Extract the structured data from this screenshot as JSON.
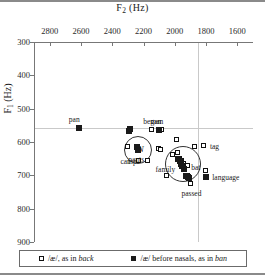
{
  "chart_data": {
    "type": "scatter",
    "title": "",
    "xlabel": "F2 (Hz)",
    "ylabel": "F1 (Hz)",
    "xlabel_base": "F",
    "xlabel_sub": "2",
    "xlabel_unit": " (Hz)",
    "ylabel_base": "F",
    "ylabel_sub": "1",
    "ylabel_unit": " (Hz)",
    "x_axis_position": "top",
    "y_axis_position": "left",
    "x_reversed": true,
    "y_reversed": true,
    "xlim": [
      2900,
      1500
    ],
    "ylim": [
      300,
      900
    ],
    "xticks": [
      2800,
      2600,
      2400,
      2200,
      2000,
      1800,
      1600
    ],
    "yticks": [
      300,
      400,
      500,
      600,
      700,
      800,
      900
    ],
    "xtick_labels": [
      "2800",
      "2600",
      "2400",
      "2200",
      "2000",
      "1800",
      "1600"
    ],
    "ytick_labels": [
      "300",
      "400",
      "500",
      "600",
      "700",
      "800",
      "900"
    ],
    "grid": true,
    "gridlines": {
      "horizontal": [
        555
      ],
      "vertical": [
        1860
      ]
    },
    "legend_position": "bottom",
    "series": [
      {
        "name": "/æ/, as in back",
        "marker": "open-square",
        "points": [
          {
            "x": 2305,
            "y": 613,
            "label": ""
          },
          {
            "x": 2235,
            "y": 655,
            "label": ""
          },
          {
            "x": 2175,
            "y": 655,
            "label": "camp",
            "label_pos": "left"
          },
          {
            "x": 2150,
            "y": 560,
            "label": "began",
            "label_pos": "above"
          },
          {
            "x": 2085,
            "y": 560,
            "label": "man2",
            "label_pos": "none"
          },
          {
            "x": 2110,
            "y": 617,
            "label": "",
            "label_pos": "none"
          },
          {
            "x": 2095,
            "y": 620,
            "label": "",
            "label_pos": "none"
          },
          {
            "x": 2020,
            "y": 635,
            "label": "",
            "label_pos": "none"
          },
          {
            "x": 1995,
            "y": 590,
            "label": "",
            "label_pos": "none"
          },
          {
            "x": 1985,
            "y": 630,
            "label": "",
            "label_pos": "none"
          },
          {
            "x": 1975,
            "y": 648,
            "label": "",
            "label_pos": "none"
          },
          {
            "x": 1960,
            "y": 655,
            "label": "",
            "label_pos": "none"
          },
          {
            "x": 1950,
            "y": 662,
            "label": "",
            "label_pos": "none"
          },
          {
            "x": 1940,
            "y": 672,
            "label": "bat",
            "label_pos": "right"
          },
          {
            "x": 1925,
            "y": 668,
            "label": "",
            "label_pos": "none"
          },
          {
            "x": 1920,
            "y": 700,
            "label": "",
            "label_pos": "none"
          },
          {
            "x": 2055,
            "y": 700,
            "label": "",
            "label_pos": "none"
          },
          {
            "x": 1900,
            "y": 722,
            "label": "passed",
            "label_pos": "below"
          },
          {
            "x": 1880,
            "y": 612,
            "label": "",
            "label_pos": "none"
          },
          {
            "x": 1820,
            "y": 608,
            "label": "tag",
            "label_pos": "right"
          },
          {
            "x": 1810,
            "y": 685,
            "label": "",
            "label_pos": "none"
          }
        ]
      },
      {
        "name": "/æ/ before nasals, as in ban",
        "marker": "filled-square",
        "points": [
          {
            "x": 2620,
            "y": 556,
            "label": "pan",
            "label_pos": "above-left"
          },
          {
            "x": 2300,
            "y": 563,
            "label": "",
            "label_pos": "none"
          },
          {
            "x": 2290,
            "y": 557,
            "label": "began",
            "label_pos": "none"
          },
          {
            "x": 2250,
            "y": 613,
            "label": "",
            "label_pos": "none"
          },
          {
            "x": 2240,
            "y": 620,
            "label": "pants",
            "label_pos": "below"
          },
          {
            "x": 2105,
            "y": 562,
            "label": "man",
            "label_pos": "above"
          },
          {
            "x": 1985,
            "y": 648,
            "label": "",
            "label_pos": "none"
          },
          {
            "x": 1975,
            "y": 655,
            "label": "",
            "label_pos": "none"
          },
          {
            "x": 1965,
            "y": 662,
            "label": "",
            "label_pos": "none"
          },
          {
            "x": 1958,
            "y": 670,
            "label": "",
            "label_pos": "none"
          },
          {
            "x": 1950,
            "y": 678,
            "label": "family",
            "label_pos": "left"
          },
          {
            "x": 1935,
            "y": 700,
            "label": "",
            "label_pos": "none"
          },
          {
            "x": 1925,
            "y": 703,
            "label": "",
            "label_pos": "none"
          },
          {
            "x": 1915,
            "y": 705,
            "label": "",
            "label_pos": "none"
          },
          {
            "x": 1805,
            "y": 703,
            "label": "language",
            "label_pos": "right"
          }
        ]
      }
    ],
    "annotations": [
      {
        "type": "circle",
        "label": "N",
        "cx": 2250,
        "cy": 617,
        "r_px": 13
      },
      {
        "type": "circle",
        "label": "",
        "cx": 1960,
        "cy": 660,
        "r_px": 17
      }
    ]
  },
  "legend": {
    "items": [
      {
        "marker": "open-square",
        "prefix": "/æ/, as in ",
        "italic_word": "back"
      },
      {
        "marker": "filled-square",
        "prefix": "/æ/ before nasals, as in ",
        "italic_word": "ban"
      }
    ]
  }
}
